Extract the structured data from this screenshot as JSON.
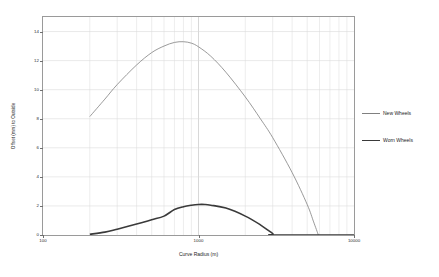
{
  "chart_data": {
    "type": "line",
    "title": "",
    "xlabel": "Curve Radius (m)",
    "ylabel": "Offset (mm) to Outside",
    "xscale": "log",
    "xlim": [
      100,
      10000
    ],
    "ylim": [
      0,
      15
    ],
    "yticks": [
      0,
      2,
      4,
      6,
      8,
      10,
      12,
      14
    ],
    "ytick_labels": [
      "0",
      "2",
      "4",
      "6",
      "8",
      "10",
      "12",
      "14"
    ],
    "xticks": [
      100,
      1000,
      10000
    ],
    "xtick_labels": [
      "100",
      "1000",
      "10000"
    ],
    "grid": true,
    "legend_position": "right",
    "series": [
      {
        "name": "New Wheels",
        "color": "#808080",
        "width": 0.8,
        "points": [
          [
            200,
            8.15
          ],
          [
            250,
            9.35
          ],
          [
            300,
            10.35
          ],
          [
            400,
            11.7
          ],
          [
            500,
            12.55
          ],
          [
            600,
            13.0
          ],
          [
            700,
            13.25
          ],
          [
            800,
            13.3
          ],
          [
            900,
            13.2
          ],
          [
            1000,
            12.95
          ],
          [
            1200,
            12.3
          ],
          [
            1500,
            11.2
          ],
          [
            2000,
            9.5
          ],
          [
            2500,
            8.0
          ],
          [
            3000,
            6.7
          ],
          [
            4000,
            4.3
          ],
          [
            5000,
            2.1
          ],
          [
            5500,
            0.9
          ],
          [
            5900,
            0.0
          ]
        ]
      },
      {
        "name": "Worn Wheels",
        "color": "#3a3a3a",
        "width": 1.6,
        "points": [
          [
            200,
            0.05
          ],
          [
            250,
            0.2
          ],
          [
            300,
            0.4
          ],
          [
            400,
            0.75
          ],
          [
            500,
            1.05
          ],
          [
            600,
            1.3
          ],
          [
            700,
            1.75
          ],
          [
            800,
            1.95
          ],
          [
            900,
            2.05
          ],
          [
            1000,
            2.1
          ],
          [
            1100,
            2.1
          ],
          [
            1200,
            2.05
          ],
          [
            1500,
            1.85
          ],
          [
            2000,
            1.3
          ],
          [
            2500,
            0.7
          ],
          [
            3000,
            0.1
          ],
          [
            3100,
            0.0
          ],
          [
            10000,
            0.0
          ]
        ]
      }
    ]
  },
  "legend": {
    "entries": [
      {
        "label": "New Wheels"
      },
      {
        "label": "Worn Wheels"
      }
    ]
  }
}
